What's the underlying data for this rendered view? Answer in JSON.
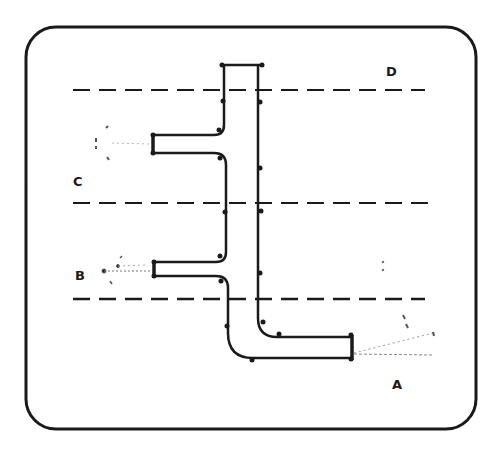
{
  "diagram": {
    "type": "pipe-manifold-schematic",
    "labels": {
      "A": "A",
      "B": "B",
      "C": "C",
      "D": "D"
    },
    "zones": [
      {
        "id": "D",
        "description": "region above top dashed line"
      },
      {
        "id": "C",
        "description": "region between top and middle dashed lines, contains upper branch outlet"
      },
      {
        "id": "B",
        "description": "region between middle and bottom dashed lines, contains lower branch outlet"
      },
      {
        "id": "A",
        "description": "region below bottom dashed line, contains elbow outlet"
      }
    ],
    "colors": {
      "stroke": "#1a1a1a",
      "background": "#ffffff",
      "spray": "#777777"
    }
  }
}
